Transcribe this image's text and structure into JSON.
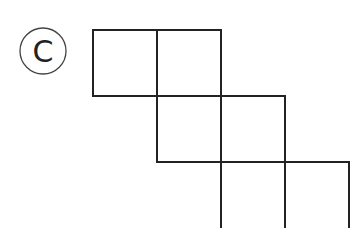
{
  "option_label": "C",
  "figure": {
    "cell_size": 64,
    "line_color": "#222222",
    "rows": [
      {
        "row": 0,
        "cells": [
          0,
          1
        ]
      },
      {
        "row": 1,
        "cells": [
          1,
          2
        ]
      },
      {
        "row": 2,
        "cells": [
          2,
          3
        ]
      }
    ]
  }
}
